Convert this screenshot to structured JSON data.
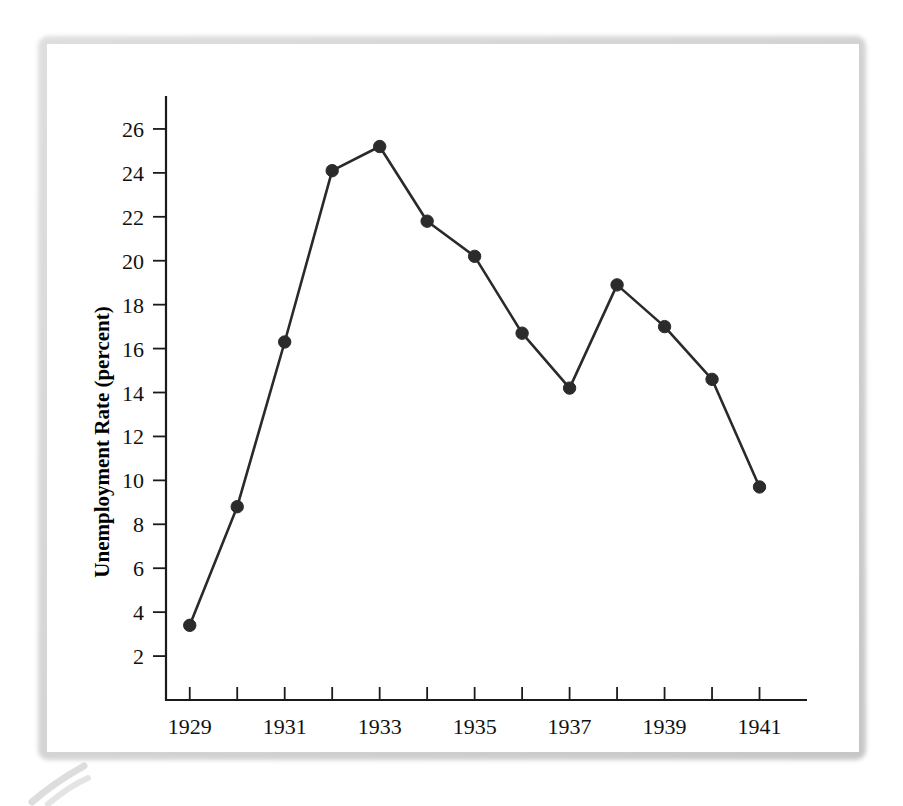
{
  "figure": {
    "frame_color": "#cccccc",
    "background": "#ffffff",
    "line_color": "#2a2a2a",
    "marker_color": "#2b2b2b",
    "axis_color": "#1a1a1a"
  },
  "chart_data": {
    "type": "line",
    "title": "",
    "xlabel": "",
    "ylabel": "Unemployment Rate (percent)",
    "x": [
      1929,
      1930,
      1931,
      1932,
      1933,
      1934,
      1935,
      1936,
      1937,
      1938,
      1939,
      1940,
      1941
    ],
    "values": [
      3.4,
      8.8,
      16.3,
      24.1,
      25.2,
      21.8,
      20.2,
      16.7,
      14.2,
      18.9,
      17.0,
      14.6,
      9.7
    ],
    "series": [
      {
        "name": "Unemployment Rate",
        "values": [
          3.4,
          8.8,
          16.3,
          24.1,
          25.2,
          21.8,
          20.2,
          16.7,
          14.2,
          18.9,
          17.0,
          14.6,
          9.7
        ]
      }
    ],
    "xlim": [
      1928.5,
      1942.0
    ],
    "ylim": [
      0,
      27.5
    ],
    "x_tick_labels": [
      "1929",
      "1931",
      "1933",
      "1935",
      "1937",
      "1939",
      "1941"
    ],
    "x_tick_values": [
      1929,
      1931,
      1933,
      1935,
      1937,
      1939,
      1941
    ],
    "x_minor_ticks": [
      1929,
      1930,
      1931,
      1932,
      1933,
      1934,
      1935,
      1936,
      1937,
      1938,
      1939,
      1940,
      1941
    ],
    "y_tick_labels": [
      "2",
      "4",
      "6",
      "8",
      "10",
      "12",
      "14",
      "16",
      "18",
      "20",
      "22",
      "24",
      "26"
    ],
    "y_tick_values": [
      2,
      4,
      6,
      8,
      10,
      12,
      14,
      16,
      18,
      20,
      22,
      24,
      26
    ],
    "grid": false,
    "legend": false,
    "markers": true,
    "marker_shape": "circle"
  }
}
